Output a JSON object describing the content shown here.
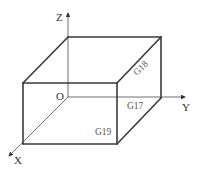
{
  "diagram": {
    "type": "coordinate-planes-box",
    "axes": {
      "x_label": "X",
      "y_label": "Y",
      "z_label": "Z",
      "origin_label": "O"
    },
    "planes": {
      "xy": "G17",
      "zx": "G18",
      "yz": "G19"
    },
    "colors": {
      "edges": "#3a3a3a",
      "axes": "#4a4a4a",
      "text": "#333333",
      "background": "#ffffff"
    }
  }
}
